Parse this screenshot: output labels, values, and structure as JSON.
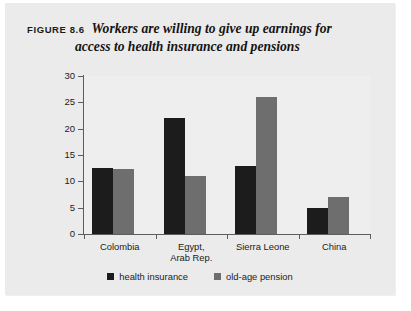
{
  "figure": {
    "label": "FIGURE 8.6",
    "title_line1": "Workers are willing to give up earnings for",
    "title_line2": "access to health insurance and pensions"
  },
  "legend": {
    "entries": [
      {
        "label": "health insurance",
        "color": "#1c1c1c"
      },
      {
        "label": "old-age pension",
        "color": "#6e6e6e"
      }
    ]
  },
  "axis": {
    "y_title": "earnings respondents would forgo for access to benefits, %",
    "y_ticks": [
      "0",
      "5",
      "10",
      "15",
      "20",
      "25",
      "30"
    ]
  },
  "chart_data": {
    "type": "bar",
    "title": "Workers are willing to give up earnings for access to health insurance and pensions",
    "xlabel": "",
    "ylabel": "earnings respondents would forgo for access to benefits, %",
    "ylim": [
      0,
      30
    ],
    "ytick_step": 5,
    "grid": false,
    "legend_position": "bottom-center",
    "categories": [
      "Colombia",
      "Egypt, Arab Rep.",
      "Sierra Leone",
      "China"
    ],
    "category_labels_wrapped": [
      [
        "Colombia"
      ],
      [
        "Egypt,",
        "Arab Rep."
      ],
      [
        "Sierra Leone"
      ],
      [
        "China"
      ]
    ],
    "series": [
      {
        "name": "health insurance",
        "color": "#1c1c1c",
        "values": [
          12.5,
          22.0,
          13.0,
          5.0
        ]
      },
      {
        "name": "old-age pension",
        "color": "#6e6e6e",
        "values": [
          12.3,
          11.0,
          26.0,
          7.0
        ]
      }
    ]
  }
}
